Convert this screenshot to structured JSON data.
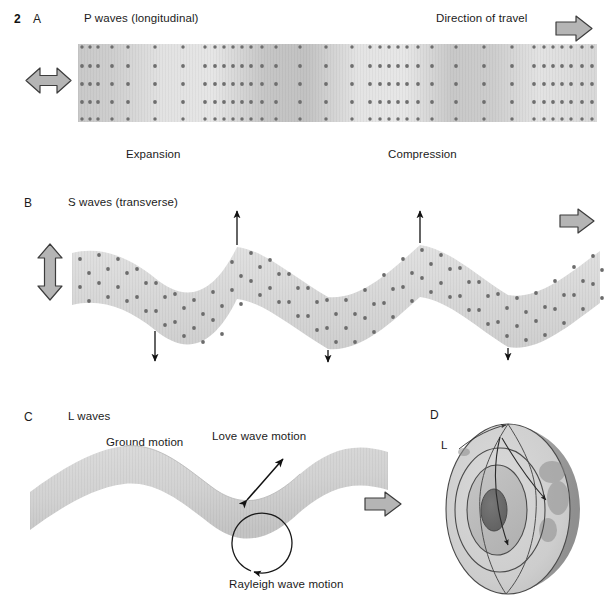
{
  "figure": {
    "number": "2",
    "title_parts": [
      "P waves (longitudinal)",
      "S waves (transverse)",
      "L waves"
    ]
  },
  "panels": [
    {
      "id": "A",
      "letter": "A",
      "heading": "P waves (longitudinal)",
      "wave_type": "P",
      "motion_arrow": "horizontal-double-arrow",
      "travel_label": "Direction of travel",
      "travel_arrow": "block-arrow-right",
      "labels": [
        {
          "name": "expansion-label",
          "text": "Expansion"
        },
        {
          "name": "compression-label",
          "text": "Compression"
        }
      ],
      "band": {
        "shape": "straight-rectangle",
        "fill": "#d9d9d9",
        "dot_color": "#7a7a7a",
        "rows": 5,
        "description": "Particle dot columns bunched into compressions and spread into rarefactions"
      }
    },
    {
      "id": "B",
      "letter": "B",
      "heading": "S waves (transverse)",
      "wave_type": "S",
      "motion_arrow": "vertical-double-arrow",
      "travel_arrow": "block-arrow-right",
      "band": {
        "shape": "sinusoid-ribbon",
        "fill": "#dcdcdc",
        "dot_color": "#6f6f6f",
        "cycles": 3,
        "description": "Sinusoidal ribbon of particles oscillating perpendicular to travel"
      },
      "up_arrows": 2,
      "down_arrows": 3
    },
    {
      "id": "C",
      "letter": "C",
      "heading": "L waves",
      "wave_type": "L",
      "travel_arrow": "block-arrow-right",
      "labels": [
        {
          "name": "ground-motion-label",
          "text": "Ground motion"
        },
        {
          "name": "love-wave-label",
          "text": "Love wave motion"
        },
        {
          "name": "rayleigh-wave-label",
          "text": "Rayleigh wave motion"
        }
      ],
      "sheet": {
        "shape": "undulating-3d-sheet",
        "fill": "#d7d7d7"
      },
      "love_arrow": "diagonal-double-arrow",
      "rayleigh_arrow": "circular-arrow-counterclockwise"
    },
    {
      "id": "D",
      "letter": "D",
      "heading": "",
      "wave_type": "Earth cross-section",
      "ray_labels": [
        {
          "name": "l-wave-ray-label",
          "text": "L"
        },
        {
          "name": "s-wave-ray-label",
          "text": "S"
        },
        {
          "name": "p-wave-ray-label",
          "text": "P"
        }
      ],
      "earth": {
        "layers": [
          "crust-surface",
          "mantle",
          "outer-core",
          "inner-core"
        ],
        "colors": {
          "surface": "#c9c9c9",
          "mantle": "#d6d6d6",
          "outer_core": "#bdbdbd",
          "inner_core": "#8a8a8a",
          "far_side": "#a8a8a8"
        }
      }
    }
  ],
  "colors": {
    "arrow_fill": "#b3b3b3",
    "arrow_stroke": "#3a3a3a",
    "ink": "#1b1b1b",
    "band_gray": "#d9d9d9",
    "dot_gray": "#757575"
  }
}
